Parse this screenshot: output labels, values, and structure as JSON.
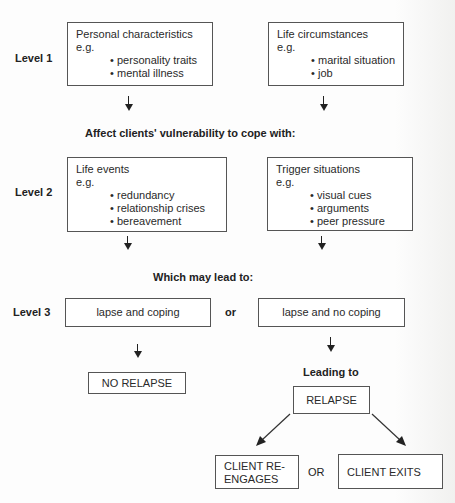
{
  "levels": {
    "level1": "Level 1",
    "level2": "Level 2",
    "level3": "Level 3"
  },
  "level1_boxes": [
    {
      "title": "Personal characteristics",
      "eg": "e.g.",
      "items": [
        "personality traits",
        "mental illness"
      ]
    },
    {
      "title": "Life circumstances",
      "eg": "e.g.",
      "items": [
        "marital situation",
        "job"
      ]
    }
  ],
  "caption1": "Affect clients' vulnerability to cope with:",
  "level2_boxes": [
    {
      "title": "Life events",
      "eg": "e.g.",
      "items": [
        "redundancy",
        "relationship crises",
        "bereavement"
      ]
    },
    {
      "title": "Trigger situations",
      "eg": "e.g.",
      "items": [
        "visual cues",
        "arguments",
        "peer pressure"
      ]
    }
  ],
  "caption2": "Which may lead to:",
  "level3": {
    "left": "lapse and coping",
    "connector": "or",
    "right": "lapse and no coping"
  },
  "outcomes": {
    "no_relapse": "NO RELAPSE",
    "leading_to": "Leading to",
    "relapse": "RELAPSE",
    "reengages": "CLIENT RE-\nENGAGES",
    "connector": "OR",
    "exits": "CLIENT EXITS"
  },
  "colors": {
    "border": "#555555",
    "text": "#222222",
    "background": "#fdfdfd"
  }
}
